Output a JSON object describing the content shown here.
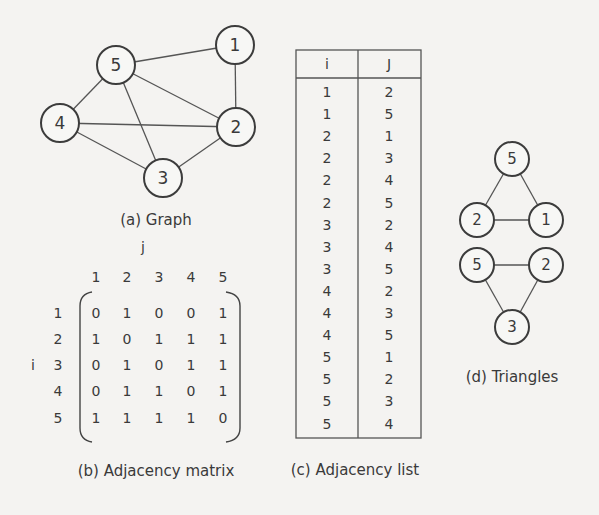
{
  "graph": {
    "caption": "(a) Graph",
    "nodes": [
      {
        "id": "1",
        "x": 235,
        "y": 45
      },
      {
        "id": "2",
        "x": 236,
        "y": 127
      },
      {
        "id": "3",
        "x": 163,
        "y": 178
      },
      {
        "id": "4",
        "x": 60,
        "y": 123
      },
      {
        "id": "5",
        "x": 116,
        "y": 65
      }
    ],
    "edges": [
      [
        "5",
        "1"
      ],
      [
        "1",
        "2"
      ],
      [
        "5",
        "2"
      ],
      [
        "5",
        "4"
      ],
      [
        "5",
        "3"
      ],
      [
        "4",
        "2"
      ],
      [
        "4",
        "3"
      ],
      [
        "3",
        "2"
      ]
    ]
  },
  "matrix": {
    "caption": "(b) Adjacency matrix",
    "row_axis": "i",
    "col_axis": "j",
    "col_headers": [
      "1",
      "2",
      "3",
      "4",
      "5"
    ],
    "row_headers": [
      "1",
      "2",
      "3",
      "4",
      "5"
    ],
    "rows": [
      [
        "0",
        "1",
        "0",
        "0",
        "1"
      ],
      [
        "1",
        "0",
        "1",
        "1",
        "1"
      ],
      [
        "0",
        "1",
        "0",
        "1",
        "1"
      ],
      [
        "0",
        "1",
        "1",
        "0",
        "1"
      ],
      [
        "1",
        "1",
        "1",
        "1",
        "0"
      ]
    ]
  },
  "adjlist": {
    "caption": "(c) Adjacency list",
    "headers": [
      "i",
      "J"
    ],
    "rows": [
      [
        "1",
        "2"
      ],
      [
        "1",
        "5"
      ],
      [
        "2",
        "1"
      ],
      [
        "2",
        "3"
      ],
      [
        "2",
        "4"
      ],
      [
        "2",
        "5"
      ],
      [
        "3",
        "2"
      ],
      [
        "3",
        "4"
      ],
      [
        "3",
        "5"
      ],
      [
        "4",
        "2"
      ],
      [
        "4",
        "3"
      ],
      [
        "4",
        "5"
      ],
      [
        "5",
        "1"
      ],
      [
        "5",
        "2"
      ],
      [
        "5",
        "3"
      ],
      [
        "5",
        "4"
      ]
    ]
  },
  "triangles": {
    "caption": "(d) Triangles",
    "list": [
      {
        "nodes": [
          {
            "id": "5",
            "x": 512,
            "y": 159
          },
          {
            "id": "2",
            "x": 477,
            "y": 220
          },
          {
            "id": "1",
            "x": 546,
            "y": 220
          }
        ]
      },
      {
        "nodes": [
          {
            "id": "5",
            "x": 477,
            "y": 265
          },
          {
            "id": "2",
            "x": 546,
            "y": 265
          },
          {
            "id": "3",
            "x": 512,
            "y": 327
          }
        ]
      }
    ]
  }
}
